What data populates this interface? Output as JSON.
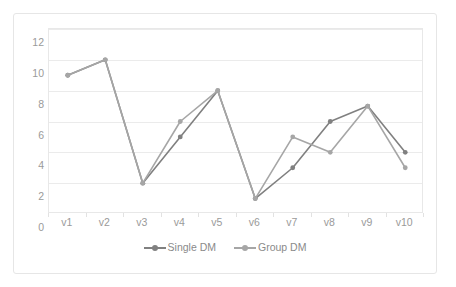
{
  "chart_data": {
    "type": "line",
    "title": "",
    "subtitle": "",
    "xlabel": "",
    "ylabel": "",
    "categories": [
      "v1",
      "v2",
      "v3",
      "v4",
      "v5",
      "v6",
      "v7",
      "v8",
      "v9",
      "v10"
    ],
    "series": [
      {
        "name": "Single DM",
        "color": "#808080",
        "values": [
          9,
          10,
          2,
          5,
          8,
          1,
          3,
          6,
          7,
          4
        ]
      },
      {
        "name": "Group DM",
        "color": "#a6a6a6",
        "values": [
          9,
          10,
          2,
          6,
          8,
          1,
          5,
          4,
          7,
          3
        ]
      }
    ],
    "ylim": [
      0,
      12
    ],
    "ytick_step": 2,
    "yticks": [
      0,
      2,
      4,
      6,
      8,
      10,
      12
    ],
    "ytick_labels": [
      "0",
      "2",
      "4",
      "6",
      "8",
      "10",
      "12"
    ],
    "grid": {
      "horizontal": true,
      "vertical": false,
      "color": "#ebebeb"
    },
    "legend": {
      "position": "bottom",
      "entries": [
        "Single DM",
        "Group DM"
      ]
    },
    "marker": "circle",
    "marker_size": 4,
    "line_width": 1.6,
    "plot_border_color": "#e8e8e8",
    "axis_label_color": "#9a9a9a",
    "frame_border_color": "#e6e6e6",
    "background": "#ffffff"
  }
}
